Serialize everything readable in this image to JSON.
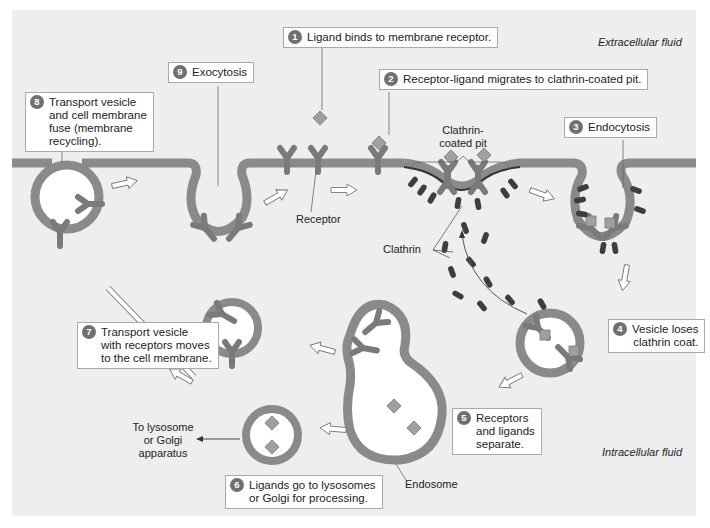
{
  "diagram": {
    "regions": {
      "extracellular": "Extracellular fluid",
      "intracellular": "Intracellular fluid"
    },
    "steps": [
      {
        "num": "1",
        "text": "Ligand binds to membrane receptor."
      },
      {
        "num": "2",
        "text": "Receptor-ligand migrates to clathrin-coated pit."
      },
      {
        "num": "3",
        "text": "Endocytosis"
      },
      {
        "num": "4",
        "text": "Vesicle loses\nclathrin coat."
      },
      {
        "num": "5",
        "text": "Receptors\nand ligands\nseparate."
      },
      {
        "num": "6",
        "text": "Ligands go to lysosomes\nor Golgi for processing."
      },
      {
        "num": "7",
        "text": "Transport vesicle\nwith receptors moves\nto the cell membrane."
      },
      {
        "num": "8",
        "text": "Transport vesicle\nand cell membrane\nfuse (membrane\nrecycling)."
      },
      {
        "num": "9",
        "text": "Exocytosis"
      }
    ],
    "labels": {
      "receptor": "Receptor",
      "clathrin_pit": "Clathrin-\ncoated pit",
      "clathrin": "Clathrin",
      "endosome": "Endosome",
      "lysosome_golgi": "To lysosome\nor Golgi\napparatus"
    },
    "colors": {
      "background": "#efefef",
      "membrane": "#8a8a8a",
      "receptor": "#7d7d7d",
      "ligand": "#9a9a9a",
      "clathrin": "#3c3c3c",
      "step_badge": "#707070"
    }
  }
}
